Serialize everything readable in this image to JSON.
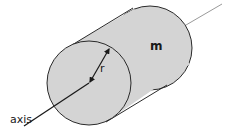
{
  "diagram": {
    "type": "cylinder-rotation-axis",
    "labels": {
      "mass": "m",
      "radius": "r",
      "axis": "axis"
    },
    "colors": {
      "fill": "#d4d4d4",
      "stroke": "#2a2a2a",
      "axis_line": "#1a1a1a",
      "axis_line_back": "#9a9a9a",
      "background": "#ffffff"
    }
  }
}
